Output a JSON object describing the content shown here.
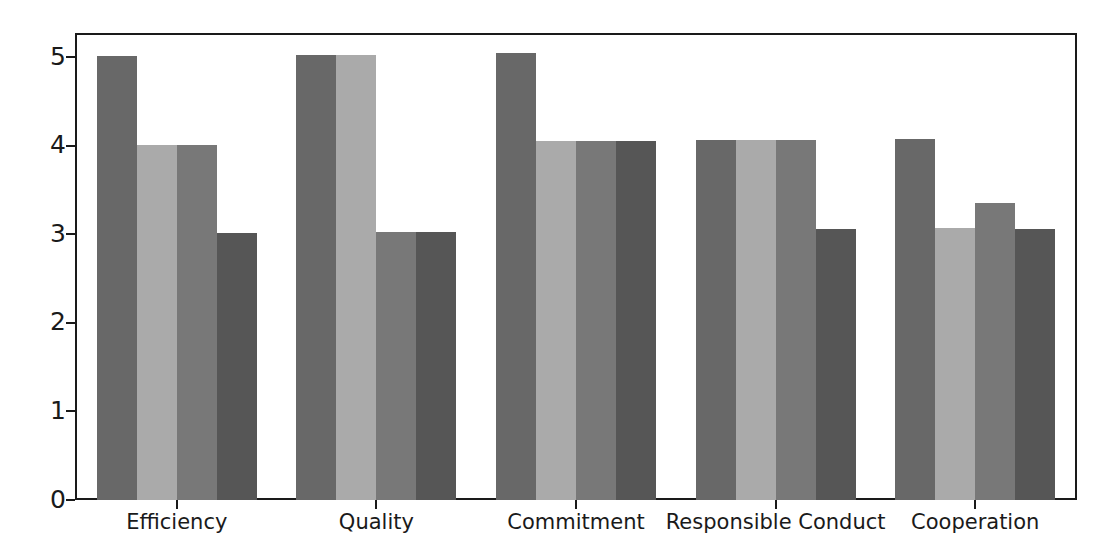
{
  "chart_data": {
    "type": "bar",
    "title": "",
    "subtitle": "",
    "xlabel": "",
    "ylabel": "",
    "grid": false,
    "legend_position": "none",
    "ylim": [
      0,
      5.25
    ],
    "yticks": [
      "0",
      "1",
      "2",
      "3",
      "4",
      "5"
    ],
    "ytick_values": [
      0,
      1,
      2,
      3,
      4,
      5
    ],
    "categories": [
      "Efficiency",
      "Quality",
      "Commitment",
      "Responsible Conduct",
      "Cooperation"
    ],
    "series": [
      {
        "name": "Series 1",
        "color": "#686868",
        "values": [
          5.01,
          5.02,
          5.05,
          4.06,
          4.08
        ]
      },
      {
        "name": "Series 2",
        "color": "#aaaaaa",
        "values": [
          4.01,
          5.02,
          4.05,
          4.06,
          3.07
        ]
      },
      {
        "name": "Series 3",
        "color": "#787878",
        "values": [
          4.01,
          3.03,
          4.05,
          4.06,
          3.35
        ]
      },
      {
        "name": "Series 4",
        "color": "#565656",
        "values": [
          3.01,
          3.03,
          4.05,
          3.06,
          3.06
        ]
      }
    ]
  },
  "axes": {
    "y_tick_labels": [
      "0",
      "1",
      "2",
      "3",
      "4",
      "5"
    ],
    "x_tick_labels": [
      "Efficiency",
      "Quality",
      "Commitment",
      "Responsible Conduct",
      "Cooperation"
    ]
  },
  "style": {
    "frame_color": "#1a1a1a",
    "background": "#ffffff",
    "tick_color": "#1a1a1a"
  }
}
